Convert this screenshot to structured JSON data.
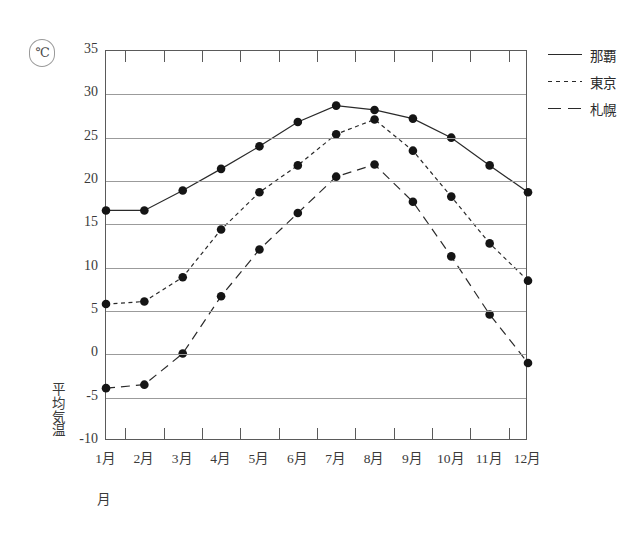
{
  "chart_data": {
    "type": "line",
    "title": "",
    "xlabel": "月",
    "ylabel": "平均気温",
    "unit_badge": "℃",
    "categories": [
      "1月",
      "2月",
      "3月",
      "4月",
      "5月",
      "6月",
      "7月",
      "8月",
      "9月",
      "10月",
      "11月",
      "12月"
    ],
    "ylim": [
      -10,
      35
    ],
    "yticks": [
      35,
      30,
      25,
      20,
      15,
      10,
      5,
      0,
      -5,
      -10
    ],
    "ytick_labels": [
      "35",
      "30",
      "25",
      "20",
      "15",
      "10",
      "5",
      "0",
      "-5",
      "-10"
    ],
    "grid": true,
    "legend_position": "right",
    "series": [
      {
        "name": "那覇",
        "style": "solid",
        "color": "#2a2a2a",
        "values": [
          16.6,
          16.6,
          18.9,
          21.4,
          24.0,
          26.8,
          28.7,
          28.2,
          27.2,
          25.0,
          21.8,
          18.7
        ]
      },
      {
        "name": "東京",
        "style": "dotted",
        "color": "#2a2a2a",
        "values": [
          5.8,
          6.1,
          8.9,
          14.4,
          18.7,
          21.8,
          25.4,
          27.1,
          23.5,
          18.2,
          12.8,
          8.5
        ]
      },
      {
        "name": "札幌",
        "style": "dashed",
        "color": "#2a2a2a",
        "values": [
          -3.9,
          -3.5,
          0.1,
          6.7,
          12.1,
          16.3,
          20.5,
          21.9,
          17.6,
          11.3,
          4.6,
          -1.0
        ]
      }
    ]
  },
  "legend": {
    "items": [
      {
        "label": "那覇"
      },
      {
        "label": "東京"
      },
      {
        "label": "札幌"
      }
    ]
  },
  "axis": {
    "y_title_chars": [
      "平",
      "均",
      "気",
      "温"
    ],
    "x_title": "月",
    "unit": "℃"
  }
}
